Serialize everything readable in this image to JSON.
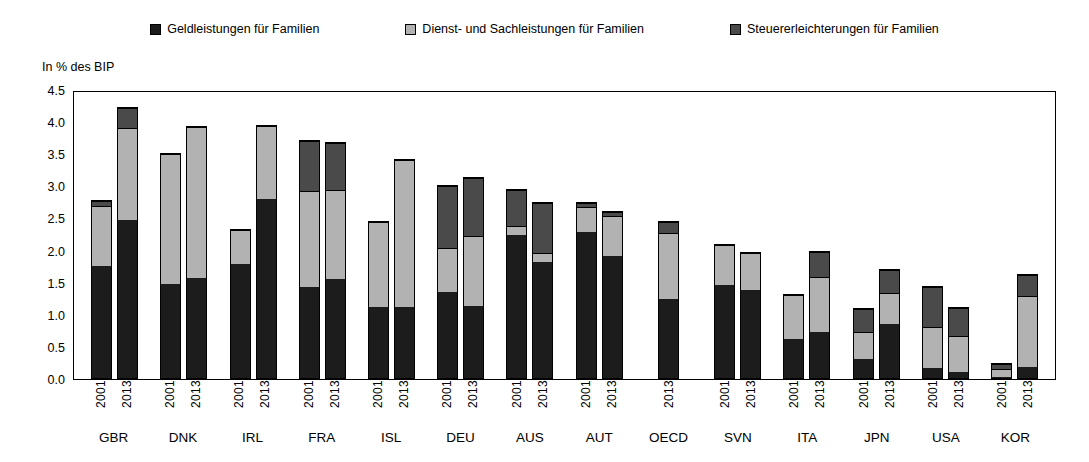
{
  "legend": {
    "items": [
      {
        "label": "Geldleistungen für Familien",
        "color": "#1c1c1c",
        "icon": "square-marker-icon"
      },
      {
        "label": "Dienst- und Sachleistungen für Familien",
        "color": "#b2b2b2",
        "icon": "square-marker-icon"
      },
      {
        "label": "Steuererleichterungen für Familien",
        "color": "#4a4a4a",
        "icon": "square-marker-icon"
      }
    ]
  },
  "axis": {
    "y_title": "In % des BIP",
    "y_ticks": [
      "0.0",
      "0.5",
      "1.0",
      "1.5",
      "2.0",
      "2.5",
      "3.0",
      "3.5",
      "4.0",
      "4.5"
    ]
  },
  "chart_data": {
    "type": "bar",
    "title": "",
    "subtitle": "",
    "xlabel": "",
    "ylabel": "In % des BIP",
    "ylim": [
      0,
      4.5
    ],
    "ytick_step": 0.5,
    "grid": false,
    "stacked": true,
    "legend_position": "top",
    "categories": [
      "GBR",
      "DNK",
      "IRL",
      "FRA",
      "ISL",
      "DEU",
      "AUS",
      "AUT",
      "OECD",
      "SVN",
      "ITA",
      "JPN",
      "USA",
      "KOR"
    ],
    "subcategories": [
      "2001",
      "2013"
    ],
    "series": [
      {
        "name": "Geldleistungen für Familien",
        "color": "#1c1c1c"
      },
      {
        "name": "Dienst- und Sachleistungen für Familien",
        "color": "#b2b2b2"
      },
      {
        "name": "Steuererleichterungen für Familien",
        "color": "#4a4a4a"
      }
    ],
    "groups": [
      {
        "category": "GBR",
        "bars": [
          {
            "year": "2001",
            "values": [
              1.8,
              0.95,
              0.07
            ],
            "total": 2.82
          },
          {
            "year": "2013",
            "values": [
              2.52,
              1.46,
              0.3
            ],
            "total": 4.28
          }
        ]
      },
      {
        "category": "DNK",
        "bars": [
          {
            "year": "2001",
            "values": [
              1.5,
              2.06,
              0.0
            ],
            "total": 3.56
          },
          {
            "year": "2013",
            "values": [
              1.6,
              2.38,
              0.0
            ],
            "total": 3.98
          }
        ]
      },
      {
        "category": "IRL",
        "bars": [
          {
            "year": "2001",
            "values": [
              1.83,
              0.53,
              0.0
            ],
            "total": 2.36
          },
          {
            "year": "2013",
            "values": [
              2.85,
              1.15,
              0.0
            ],
            "total": 4.0
          }
        ]
      },
      {
        "category": "FRA",
        "bars": [
          {
            "year": "2001",
            "values": [
              1.45,
              1.52,
              0.79
            ],
            "total": 3.76
          },
          {
            "year": "2013",
            "values": [
              1.58,
              1.42,
              0.73
            ],
            "total": 3.73
          }
        ]
      },
      {
        "category": "ISL",
        "bars": [
          {
            "year": "2001",
            "values": [
              1.14,
              1.34,
              0.0
            ],
            "total": 2.48
          },
          {
            "year": "2013",
            "values": [
              1.13,
              2.33,
              0.0
            ],
            "total": 3.46
          }
        ]
      },
      {
        "category": "DEU",
        "bars": [
          {
            "year": "2001",
            "values": [
              1.38,
              0.7,
              0.97
            ],
            "total": 3.05
          },
          {
            "year": "2013",
            "values": [
              1.16,
              1.1,
              0.92
            ],
            "total": 3.18
          }
        ]
      },
      {
        "category": "AUS",
        "bars": [
          {
            "year": "2001",
            "values": [
              2.3,
              0.13,
              0.56
            ],
            "total": 2.99
          },
          {
            "year": "2013",
            "values": [
              1.87,
              0.13,
              0.78
            ],
            "total": 2.78
          }
        ]
      },
      {
        "category": "AUT",
        "bars": [
          {
            "year": "2001",
            "values": [
              2.35,
              0.38,
              0.05
            ],
            "total": 2.78
          },
          {
            "year": "2013",
            "values": [
              1.96,
              0.64,
              0.05
            ],
            "total": 2.65
          }
        ]
      },
      {
        "category": "OECD",
        "bars": [
          {
            "year": "2013",
            "values": [
              1.28,
              1.04,
              0.16
            ],
            "total": 2.48
          }
        ]
      },
      {
        "category": "SVN",
        "bars": [
          {
            "year": "2001",
            "values": [
              1.5,
              0.62,
              0.0
            ],
            "total": 2.12
          },
          {
            "year": "2013",
            "values": [
              1.42,
              0.58,
              0.0
            ],
            "total": 2.0
          }
        ]
      },
      {
        "category": "ITA",
        "bars": [
          {
            "year": "2001",
            "values": [
              0.63,
              0.7,
              0.0
            ],
            "total": 1.33
          },
          {
            "year": "2013",
            "values": [
              0.75,
              0.87,
              0.4
            ],
            "total": 2.02
          }
        ]
      },
      {
        "category": "JPN",
        "bars": [
          {
            "year": "2001",
            "values": [
              0.31,
              0.44,
              0.37
            ],
            "total": 1.12
          },
          {
            "year": "2013",
            "values": [
              0.88,
              0.5,
              0.35
            ],
            "total": 1.73
          }
        ]
      },
      {
        "category": "USA",
        "bars": [
          {
            "year": "2001",
            "values": [
              0.17,
              0.65,
              0.64
            ],
            "total": 1.46
          },
          {
            "year": "2013",
            "values": [
              0.1,
              0.58,
              0.45
            ],
            "total": 1.13
          }
        ]
      },
      {
        "category": "KOR",
        "bars": [
          {
            "year": "2001",
            "values": [
              0.03,
              0.14,
              0.08
            ],
            "total": 0.25
          },
          {
            "year": "2013",
            "values": [
              0.18,
              1.15,
              0.33
            ],
            "total": 1.66
          }
        ]
      }
    ]
  }
}
